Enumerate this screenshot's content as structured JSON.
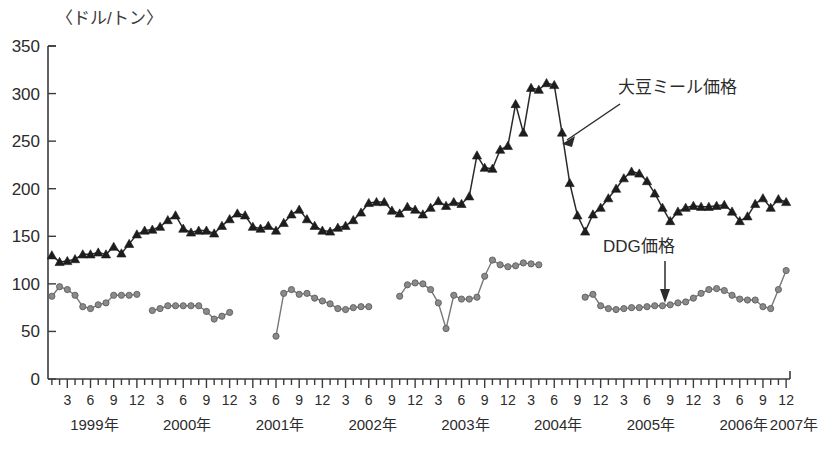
{
  "chart_data": {
    "type": "line",
    "title": "",
    "subtitle": "",
    "unit_label": "〈ドル/トン〉",
    "xlabel": "",
    "ylabel": "",
    "ylim": [
      0,
      350
    ],
    "ytick_labels": [
      "0",
      "50",
      "100",
      "150",
      "200",
      "250",
      "300",
      "350"
    ],
    "ytick_values": [
      0,
      50,
      100,
      150,
      200,
      250,
      300,
      350
    ],
    "grid": false,
    "legend_position": "annotations",
    "x_start": "1999-01",
    "x_end": "2006-12",
    "xtick_month_labels": [
      "3",
      "6",
      "9",
      "12"
    ],
    "xtick_labels": [
      "3",
      "6",
      "9",
      "12",
      "3",
      "6",
      "9",
      "12",
      "3",
      "6",
      "9",
      "12",
      "3",
      "6",
      "9",
      "12",
      "3",
      "6",
      "9",
      "12",
      "3",
      "6",
      "9",
      "12",
      "3",
      "6",
      "9",
      "12",
      "3",
      "6",
      "9",
      "12"
    ],
    "year_labels": [
      "1999年",
      "2000年",
      "2001年",
      "2002年",
      "2003年",
      "2004年",
      "2005年",
      "2006年",
      "2007年"
    ],
    "annotations": [
      {
        "text": "大豆ミール価格",
        "target_series": "soybean_meal"
      },
      {
        "text": "DDG価格",
        "target_series": "ddg"
      }
    ],
    "series": [
      {
        "name": "大豆ミール価格",
        "marker": "triangle",
        "color": "#1d1d1d",
        "x": [
          "1999-01",
          "1999-02",
          "1999-03",
          "1999-04",
          "1999-05",
          "1999-06",
          "1999-07",
          "1999-08",
          "1999-09",
          "1999-10",
          "1999-11",
          "1999-12",
          "2000-01",
          "2000-02",
          "2000-03",
          "2000-04",
          "2000-05",
          "2000-06",
          "2000-07",
          "2000-08",
          "2000-09",
          "2000-10",
          "2000-11",
          "2000-12",
          "2001-01",
          "2001-02",
          "2001-03",
          "2001-04",
          "2001-05",
          "2001-06",
          "2001-07",
          "2001-08",
          "2001-09",
          "2001-10",
          "2001-11",
          "2001-12",
          "2002-01",
          "2002-02",
          "2002-03",
          "2002-04",
          "2002-05",
          "2002-06",
          "2002-07",
          "2002-08",
          "2002-09",
          "2002-10",
          "2002-11",
          "2002-12",
          "2003-01",
          "2003-02",
          "2003-03",
          "2003-04",
          "2003-05",
          "2003-06",
          "2003-07",
          "2003-08",
          "2003-09",
          "2003-10",
          "2003-11",
          "2003-12",
          "2004-01",
          "2004-02",
          "2004-03",
          "2004-04",
          "2004-05",
          "2004-06",
          "2004-07",
          "2004-08",
          "2004-09",
          "2004-10",
          "2004-11",
          "2004-12",
          "2005-01",
          "2005-02",
          "2005-03",
          "2005-04",
          "2005-05",
          "2005-06",
          "2005-07",
          "2005-08",
          "2005-09",
          "2005-10",
          "2005-11",
          "2005-12",
          "2006-01",
          "2006-02",
          "2006-03",
          "2006-04",
          "2006-05",
          "2006-06",
          "2006-07",
          "2006-08",
          "2006-09",
          "2006-10",
          "2006-11",
          "2006-12"
        ],
        "values": [
          130,
          123,
          124,
          126,
          131,
          131,
          133,
          131,
          139,
          132,
          142,
          152,
          156,
          157,
          160,
          167,
          172,
          158,
          154,
          156,
          156,
          153,
          161,
          168,
          174,
          172,
          160,
          158,
          161,
          156,
          164,
          173,
          178,
          168,
          161,
          156,
          155,
          159,
          161,
          167,
          175,
          185,
          186,
          186,
          177,
          174,
          181,
          178,
          173,
          180,
          187,
          182,
          186,
          184,
          192,
          235,
          222,
          221,
          241,
          245,
          289,
          259,
          306,
          304,
          311,
          309,
          259,
          206,
          172,
          155,
          173,
          180,
          190,
          200,
          211,
          218,
          216,
          208,
          195,
          180,
          166,
          176,
          180,
          182,
          181,
          181,
          182,
          183,
          176,
          166,
          171,
          184,
          190,
          180,
          189,
          186
        ]
      },
      {
        "name": "DDG価格",
        "marker": "circle",
        "color": "#8a8a8a",
        "x": [
          "1999-01",
          "1999-02",
          "1999-03",
          "1999-04",
          "1999-05",
          "1999-06",
          "1999-07",
          "1999-08",
          "1999-09",
          "1999-10",
          "1999-11",
          "1999-12",
          "2000-01",
          "2000-02",
          "2000-03",
          "2000-04",
          "2000-05",
          "2000-06",
          "2000-07",
          "2000-08",
          "2000-09",
          "2000-10",
          "2000-11",
          "2000-12",
          "2001-01",
          "2001-02",
          "2001-03",
          "2001-04",
          "2001-05",
          "2001-06",
          "2001-07",
          "2001-08",
          "2001-09",
          "2001-10",
          "2001-11",
          "2001-12",
          "2002-01",
          "2002-02",
          "2002-03",
          "2002-04",
          "2002-05",
          "2002-06",
          "2002-07",
          "2002-08",
          "2002-09",
          "2002-10",
          "2002-11",
          "2002-12",
          "2003-01",
          "2003-02",
          "2003-03",
          "2003-04",
          "2003-05",
          "2003-06",
          "2003-07",
          "2003-08",
          "2003-09",
          "2003-10",
          "2003-11",
          "2003-12",
          "2004-01",
          "2004-02",
          "2004-03",
          "2004-04",
          "2004-05",
          "2004-06",
          "2004-07",
          "2004-08",
          "2004-09",
          "2004-10",
          "2004-11",
          "2004-12",
          "2005-01",
          "2005-02",
          "2005-03",
          "2005-04",
          "2005-05",
          "2005-06",
          "2005-07",
          "2005-08",
          "2005-09",
          "2005-10",
          "2005-11",
          "2005-12",
          "2006-01",
          "2006-02",
          "2006-03",
          "2006-04",
          "2006-05",
          "2006-06",
          "2006-07",
          "2006-08",
          "2006-09",
          "2006-10",
          "2006-11",
          "2006-12"
        ],
        "values": [
          87,
          97,
          94,
          88,
          76,
          74,
          78,
          80,
          88,
          88,
          88,
          89,
          null,
          72,
          74,
          77,
          77,
          77,
          77,
          77,
          71,
          63,
          66,
          70,
          null,
          null,
          null,
          null,
          null,
          45,
          90,
          94,
          89,
          90,
          85,
          82,
          79,
          74,
          73,
          75,
          76,
          76,
          null,
          null,
          null,
          87,
          99,
          101,
          100,
          94,
          80,
          53,
          88,
          84,
          84,
          86,
          108,
          125,
          120,
          118,
          119,
          122,
          121,
          120,
          null,
          null,
          null,
          null,
          null,
          86,
          89,
          77,
          74,
          73,
          74,
          75,
          75,
          76,
          77,
          77,
          78,
          80,
          81,
          85,
          90,
          94,
          95,
          93,
          88,
          84,
          83,
          83,
          76,
          74,
          94,
          114
        ]
      }
    ]
  }
}
